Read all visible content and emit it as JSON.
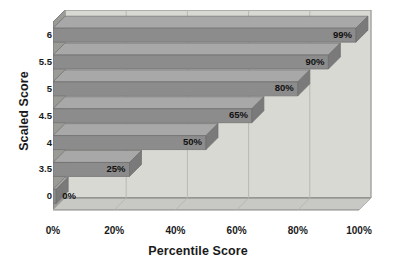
{
  "chart_data": {
    "type": "bar",
    "orientation": "horizontal",
    "style": "3d",
    "title": "",
    "xlabel": "Percentile Score",
    "ylabel": "Scaled Score",
    "categories": [
      "0",
      "3.5",
      "4",
      "4.5",
      "5",
      "5.5",
      "6"
    ],
    "values": [
      0,
      25,
      50,
      65,
      80,
      90,
      99
    ],
    "data_labels": [
      "0%",
      "25%",
      "50%",
      "65%",
      "80%",
      "90%",
      "99%"
    ],
    "xlim": [
      0,
      100
    ],
    "xticks": [
      0,
      20,
      40,
      60,
      80,
      100
    ],
    "xtick_labels": [
      "0%",
      "20%",
      "40%",
      "60%",
      "80%",
      "100%"
    ],
    "ytick_labels": [
      "6",
      "5.5",
      "5",
      "4.5",
      "4",
      "3.5",
      "0"
    ],
    "grid": "vertical",
    "legend": "none",
    "colors": {
      "bar_front": "#8c8c8c",
      "bar_top": "#a8a8a8",
      "bar_end": "#7a7a7a",
      "plot_background": "#d9d9d4",
      "wall_side": "#9a9a97",
      "floor": "#c8c8c4",
      "gridline": "#b4b4b0",
      "border": "#6e6e6e",
      "text": "#1a1a1a"
    }
  },
  "axes": {
    "y_title": "Scaled Score",
    "x_title": "Percentile Score"
  }
}
